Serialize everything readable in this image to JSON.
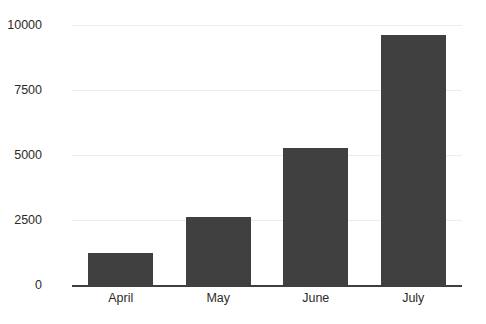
{
  "chart_data": {
    "type": "bar",
    "title": "",
    "subtitle": "",
    "xlabel": "",
    "ylabel": "",
    "categories": [
      "April",
      "May",
      "June",
      "July"
    ],
    "values": [
      1230,
      2620,
      5270,
      9620
    ],
    "series": [
      {
        "name": "",
        "values": [
          1230,
          2620,
          5270,
          9620
        ]
      }
    ],
    "ylim": [
      0,
      10000
    ],
    "yticks": [
      0,
      2500,
      5000,
      7500,
      10000
    ],
    "ytick_labels": [
      "0",
      "2500",
      "5000",
      "7500",
      "10000"
    ],
    "grid": "horizontal",
    "legend": "none",
    "annotations": [],
    "colors": {
      "bar_fill": "#404040",
      "gridline": "#ececec",
      "axis_line": "#3f3f3f",
      "tick_label": "#2b2b2b",
      "background": "#ffffff"
    }
  }
}
